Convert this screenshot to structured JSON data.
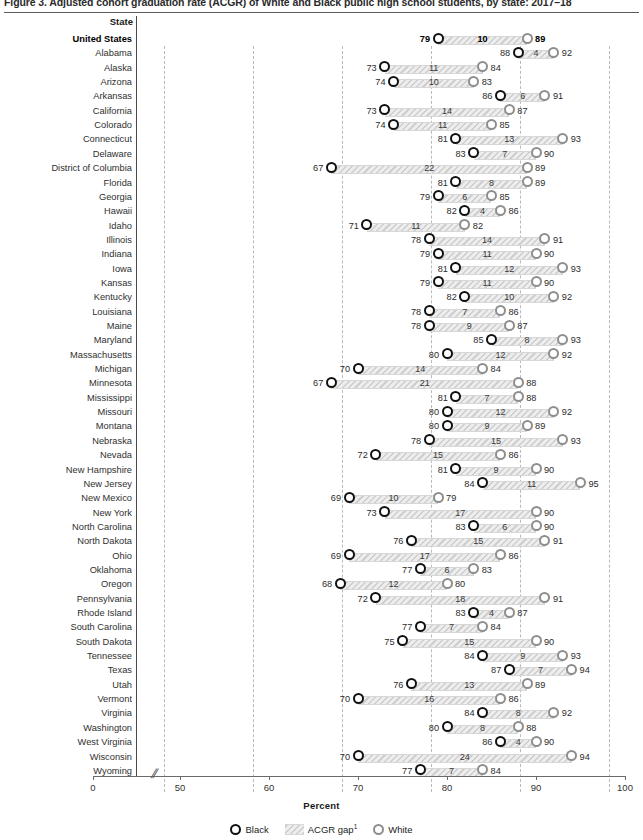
{
  "figure": {
    "title": "Figure 3.  Adjusted cohort graduation rate (ACGR) of White and Black public high school students, by state: 2017–18",
    "state_column_header": "State",
    "xaxis_label": "Percent",
    "footnote_marker": "1"
  },
  "legend": {
    "position": "bottom-center",
    "items": [
      {
        "key": "black",
        "label": "Black"
      },
      {
        "key": "gap",
        "label": "ACGR gap"
      },
      {
        "key": "white",
        "label": "White"
      }
    ]
  },
  "axis": {
    "ticks": [
      0,
      50,
      60,
      70,
      80,
      90,
      100
    ],
    "tick_labels": [
      "0",
      "50",
      "60",
      "70",
      "80",
      "90",
      "100"
    ],
    "gridlines_at": [
      50,
      60,
      70,
      80,
      90,
      100
    ],
    "break_after": 0,
    "break_glyph": "//"
  },
  "colors": {
    "black_marker": "#111111",
    "white_marker": "#8e8e8e",
    "gap_band": "#dcdcdc",
    "gridline": "#b9b9b9",
    "axis": "#6a6a6a"
  },
  "chart_data": {
    "type": "bar",
    "subtype": "dumbbell-range",
    "title": "Adjusted cohort graduation rate (ACGR) of White and Black public high school students, by state: 2017–18",
    "xlabel": "Percent",
    "ylabel": "State",
    "xlim": [
      0,
      100
    ],
    "xticks": [
      0,
      50,
      60,
      70,
      80,
      90,
      100
    ],
    "grid": true,
    "series": [
      {
        "name": "Black",
        "key": "black"
      },
      {
        "name": "ACGR gap",
        "key": "gap"
      },
      {
        "name": "White",
        "key": "white"
      }
    ],
    "categories": [
      "United States",
      "Alabama",
      "Alaska",
      "Arizona",
      "Arkansas",
      "California",
      "Colorado",
      "Connecticut",
      "Delaware",
      "District of Columbia",
      "Florida",
      "Georgia",
      "Hawaii",
      "Idaho",
      "Illinois",
      "Indiana",
      "Iowa",
      "Kansas",
      "Kentucky",
      "Louisiana",
      "Maine",
      "Maryland",
      "Massachusetts",
      "Michigan",
      "Minnesota",
      "Mississippi",
      "Missouri",
      "Montana",
      "Nebraska",
      "Nevada",
      "New Hampshire",
      "New Jersey",
      "New Mexico",
      "New York",
      "North Carolina",
      "North Dakota",
      "Ohio",
      "Oklahoma",
      "Oregon",
      "Pennsylvania",
      "Rhode Island",
      "South Carolina",
      "South Dakota",
      "Tennessee",
      "Texas",
      "Utah",
      "Vermont",
      "Virginia",
      "Washington",
      "West Virginia",
      "Wisconsin",
      "Wyoming"
    ],
    "rows": [
      {
        "state": "United States",
        "black": 79,
        "gap": 10,
        "white": 89,
        "emphasis": true
      },
      {
        "state": "Alabama",
        "black": 88,
        "gap": 4,
        "white": 92
      },
      {
        "state": "Alaska",
        "black": 73,
        "gap": 11,
        "white": 84
      },
      {
        "state": "Arizona",
        "black": 74,
        "gap": 10,
        "white": 83
      },
      {
        "state": "Arkansas",
        "black": 86,
        "gap": 6,
        "white": 91
      },
      {
        "state": "California",
        "black": 73,
        "gap": 14,
        "white": 87
      },
      {
        "state": "Colorado",
        "black": 74,
        "gap": 11,
        "white": 85
      },
      {
        "state": "Connecticut",
        "black": 81,
        "gap": 13,
        "white": 93
      },
      {
        "state": "Delaware",
        "black": 83,
        "gap": 7,
        "white": 90
      },
      {
        "state": "District of Columbia",
        "black": 67,
        "gap": 22,
        "white": 89
      },
      {
        "state": "Florida",
        "black": 81,
        "gap": 8,
        "white": 89
      },
      {
        "state": "Georgia",
        "black": 79,
        "gap": 6,
        "white": 85
      },
      {
        "state": "Hawaii",
        "black": 82,
        "gap": 4,
        "white": 86
      },
      {
        "state": "Idaho",
        "black": 71,
        "gap": 11,
        "white": 82
      },
      {
        "state": "Illinois",
        "black": 78,
        "gap": 14,
        "white": 91
      },
      {
        "state": "Indiana",
        "black": 79,
        "gap": 11,
        "white": 90
      },
      {
        "state": "Iowa",
        "black": 81,
        "gap": 12,
        "white": 93
      },
      {
        "state": "Kansas",
        "black": 79,
        "gap": 11,
        "white": 90
      },
      {
        "state": "Kentucky",
        "black": 82,
        "gap": 10,
        "white": 92
      },
      {
        "state": "Louisiana",
        "black": 78,
        "gap": 7,
        "white": 86
      },
      {
        "state": "Maine",
        "black": 78,
        "gap": 9,
        "white": 87
      },
      {
        "state": "Maryland",
        "black": 85,
        "gap": 8,
        "white": 93
      },
      {
        "state": "Massachusetts",
        "black": 80,
        "gap": 12,
        "white": 92
      },
      {
        "state": "Michigan",
        "black": 70,
        "gap": 14,
        "white": 84
      },
      {
        "state": "Minnesota",
        "black": 67,
        "gap": 21,
        "white": 88
      },
      {
        "state": "Mississippi",
        "black": 81,
        "gap": 7,
        "white": 88
      },
      {
        "state": "Missouri",
        "black": 80,
        "gap": 12,
        "white": 92
      },
      {
        "state": "Montana",
        "black": 80,
        "gap": 9,
        "white": 89
      },
      {
        "state": "Nebraska",
        "black": 78,
        "gap": 15,
        "white": 93
      },
      {
        "state": "Nevada",
        "black": 72,
        "gap": 15,
        "white": 86
      },
      {
        "state": "New Hampshire",
        "black": 81,
        "gap": 9,
        "white": 90
      },
      {
        "state": "New Jersey",
        "black": 84,
        "gap": 11,
        "white": 95
      },
      {
        "state": "New Mexico",
        "black": 69,
        "gap": 10,
        "white": 79
      },
      {
        "state": "New York",
        "black": 73,
        "gap": 17,
        "white": 90
      },
      {
        "state": "North Carolina",
        "black": 83,
        "gap": 6,
        "white": 90
      },
      {
        "state": "North Dakota",
        "black": 76,
        "gap": 15,
        "white": 91
      },
      {
        "state": "Ohio",
        "black": 69,
        "gap": 17,
        "white": 86
      },
      {
        "state": "Oklahoma",
        "black": 77,
        "gap": 6,
        "white": 83
      },
      {
        "state": "Oregon",
        "black": 68,
        "gap": 12,
        "white": 80
      },
      {
        "state": "Pennsylvania",
        "black": 72,
        "gap": 18,
        "white": 91
      },
      {
        "state": "Rhode Island",
        "black": 83,
        "gap": 4,
        "white": 87
      },
      {
        "state": "South Carolina",
        "black": 77,
        "gap": 7,
        "white": 84
      },
      {
        "state": "South Dakota",
        "black": 75,
        "gap": 15,
        "white": 90
      },
      {
        "state": "Tennessee",
        "black": 84,
        "gap": 9,
        "white": 93
      },
      {
        "state": "Texas",
        "black": 87,
        "gap": 7,
        "white": 94
      },
      {
        "state": "Utah",
        "black": 76,
        "gap": 13,
        "white": 89
      },
      {
        "state": "Vermont",
        "black": 70,
        "gap": 16,
        "white": 86
      },
      {
        "state": "Virginia",
        "black": 84,
        "gap": 8,
        "white": 92
      },
      {
        "state": "Washington",
        "black": 80,
        "gap": 8,
        "white": 88
      },
      {
        "state": "West Virginia",
        "black": 86,
        "gap": 4,
        "white": 90
      },
      {
        "state": "Wisconsin",
        "black": 70,
        "gap": 24,
        "white": 94
      },
      {
        "state": "Wyoming",
        "black": 77,
        "gap": 7,
        "white": 84
      }
    ]
  }
}
